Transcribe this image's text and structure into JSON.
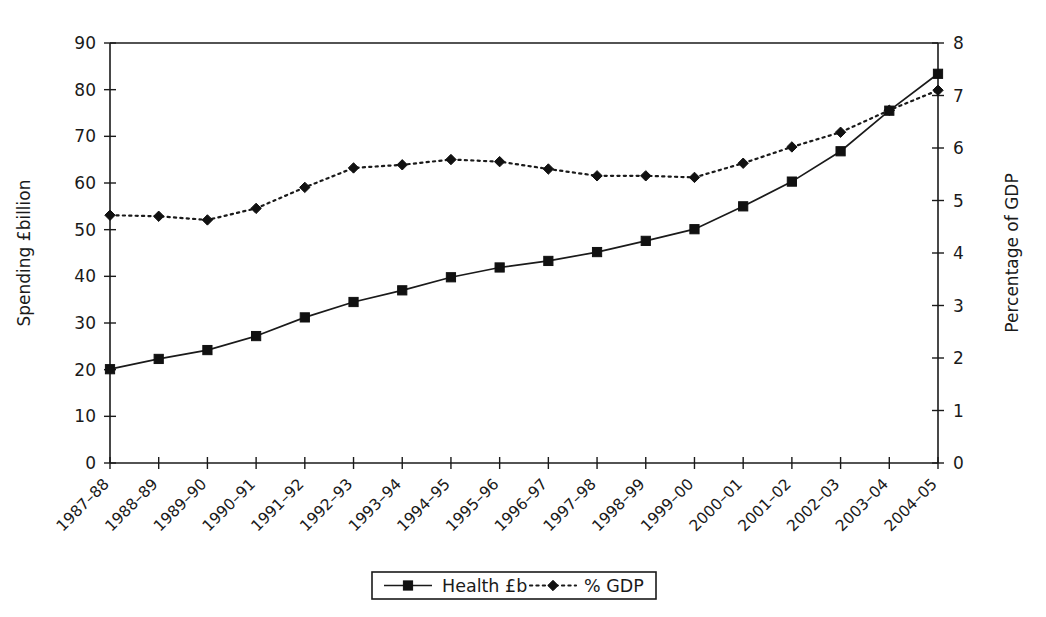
{
  "chart_data": {
    "type": "line",
    "title": "",
    "xlabel": "",
    "ylabel": "Spending £billion",
    "y2label": "Percentage of GDP",
    "ylim": [
      0,
      90
    ],
    "y2lim": [
      0,
      8
    ],
    "yticks": [
      "0",
      "10",
      "20",
      "30",
      "40",
      "50",
      "60",
      "70",
      "80",
      "90"
    ],
    "y2ticks": [
      "0",
      "1",
      "2",
      "3",
      "4",
      "5",
      "6",
      "7",
      "8"
    ],
    "grid": false,
    "legend_position": "bottom-center",
    "categories": [
      "1987–88",
      "1988–89",
      "1989–90",
      "1990–91",
      "1991–92",
      "1992–93",
      "1993–94",
      "1994–95",
      "1995–96",
      "1996–97",
      "1997–98",
      "1998–99",
      "1999–00",
      "2000–01",
      "2001–02",
      "2002–03",
      "2003–04",
      "2004–05"
    ],
    "series": [
      {
        "name": "Health £b",
        "axis": "left",
        "marker": "square",
        "line": "solid",
        "color": "#111111",
        "values": [
          20.1,
          22.3,
          24.2,
          27.2,
          31.2,
          34.5,
          37.0,
          39.8,
          41.9,
          43.3,
          45.2,
          47.6,
          50.1,
          55.0,
          60.3,
          66.8,
          75.5,
          83.4
        ]
      },
      {
        "name": "% GDP",
        "axis": "right",
        "marker": "diamond",
        "line": "dotted",
        "color": "#111111",
        "values": [
          4.72,
          4.7,
          4.63,
          4.85,
          5.25,
          5.62,
          5.68,
          5.78,
          5.74,
          5.6,
          5.47,
          5.47,
          5.44,
          5.71,
          6.02,
          6.3,
          6.72,
          7.1
        ]
      }
    ]
  },
  "legend": {
    "items": [
      {
        "label": "Health £b"
      },
      {
        "label": "% GDP"
      }
    ]
  },
  "colors": {
    "ink": "#1a1a1a",
    "marker": "#111111",
    "background": "#ffffff"
  }
}
